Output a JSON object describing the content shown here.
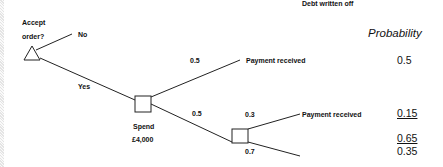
{
  "diagram": {
    "type": "decision-tree",
    "decision_node": {
      "label_line1": "Accept",
      "label_line2": "order?",
      "shape": "triangle"
    },
    "branches": {
      "no": "No",
      "yes": "Yes"
    },
    "chance_node_1": {
      "label_line1": "Spend",
      "label_line2": "£4,000",
      "shape": "square",
      "branches": [
        {
          "prob": "0.5",
          "outcome": "Payment received"
        },
        {
          "prob": "0.5",
          "outcome": ""
        }
      ]
    },
    "chance_node_2": {
      "shape": "square",
      "branches": [
        {
          "prob": "0.3",
          "outcome": "Payment received"
        },
        {
          "prob": "0.7",
          "outcome": "Debt written off"
        }
      ]
    },
    "probability_column": {
      "header": "Probability",
      "values": [
        {
          "value": "0.5",
          "underline": false
        },
        {
          "value": "0.15",
          "underline": true
        },
        {
          "value": "0.65",
          "underline": true
        },
        {
          "value": "0.35",
          "underline": false
        }
      ]
    }
  }
}
